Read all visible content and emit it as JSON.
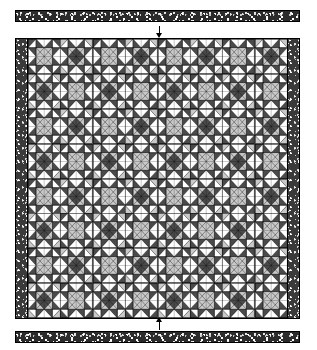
{
  "diagram": {
    "type": "quilt-pattern-line-art",
    "background_color": "#ffffff",
    "ink_color": "#000000"
  },
  "quilt": {
    "grid_columns": 8,
    "grid_rows": 8,
    "block_name": "eight-pointed star / square-in-a-square pieced block",
    "side_border_label": "pieced dark print side border",
    "side_border_color": "#3a3a3a",
    "fabrics": [
      {
        "key": "light",
        "label": "background light / white",
        "color": "#ffffff"
      },
      {
        "key": "medium",
        "label": "medium grey print",
        "color": "#c9c9c9"
      },
      {
        "key": "dark",
        "label": "dark print",
        "color": "#4a4a4a"
      },
      {
        "key": "black",
        "label": "solid black outline",
        "color": "#000000"
      }
    ],
    "block_layout": [
      [
        "A",
        "B",
        "A",
        "B",
        "A",
        "B",
        "A",
        "B"
      ],
      [
        "B",
        "A",
        "B",
        "A",
        "B",
        "A",
        "B",
        "A"
      ],
      [
        "A",
        "B",
        "A",
        "B",
        "A",
        "B",
        "A",
        "B"
      ],
      [
        "B",
        "A",
        "B",
        "A",
        "B",
        "A",
        "B",
        "A"
      ],
      [
        "A",
        "B",
        "A",
        "B",
        "A",
        "B",
        "A",
        "B"
      ],
      [
        "B",
        "A",
        "B",
        "A",
        "B",
        "A",
        "B",
        "A"
      ],
      [
        "A",
        "B",
        "A",
        "B",
        "A",
        "B",
        "A",
        "B"
      ],
      [
        "B",
        "A",
        "B",
        "A",
        "B",
        "A",
        "B",
        "A"
      ]
    ]
  },
  "strips": {
    "top": {
      "label": "top border strip",
      "fabric": "dark print",
      "color": "#2b2b2b"
    },
    "bottom": {
      "label": "bottom border strip",
      "fabric": "dark print",
      "color": "#2b2b2b"
    }
  },
  "arrows": {
    "top": {
      "label": "attach top border strip",
      "direction": "down",
      "glyph": "arrow-down-icon"
    },
    "bottom": {
      "label": "attach bottom border strip",
      "direction": "up",
      "glyph": "arrow-up-icon"
    }
  }
}
